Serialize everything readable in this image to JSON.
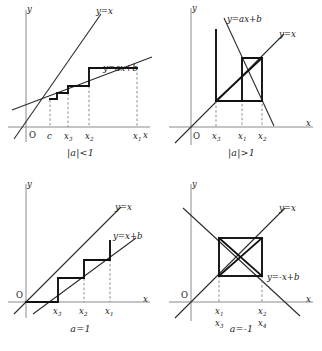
{
  "figure": {
    "panels": [
      {
        "id": "top-left",
        "caption": "|a|<1",
        "axis_x_label": "x",
        "axis_y_label": "y",
        "origin_label": "O",
        "line_identity": "y=x",
        "line_map": "y=ax+b",
        "x_ticks": [
          "c",
          "x",
          "x",
          "x"
        ],
        "x_tick_subs": [
          "",
          "3",
          "2",
          "1"
        ],
        "behavior": "converging staircase toward fixed point c"
      },
      {
        "id": "top-right",
        "caption": "|a|>1",
        "axis_x_label": "x",
        "axis_y_label": "y",
        "origin_label": "O",
        "line_identity": "y=x",
        "line_map": "y=ax+b",
        "x_ticks": [
          "x",
          "x",
          "x"
        ],
        "x_tick_subs": [
          "3",
          "1",
          "2"
        ],
        "behavior": "diverging cobweb away from fixed point"
      },
      {
        "id": "bottom-left",
        "caption": "a=1",
        "axis_x_label": "x",
        "axis_y_label": "y",
        "origin_label": "O",
        "line_identity": "y=x",
        "line_map": "y=x+b",
        "x_ticks": [
          "x",
          "x",
          "x"
        ],
        "x_tick_subs": [
          "3",
          "2",
          "1"
        ],
        "behavior": "monotone ascending staircase, no fixed point"
      },
      {
        "id": "bottom-right",
        "caption": "a=-1",
        "axis_x_label": "x",
        "axis_y_label": "y",
        "origin_label": "O",
        "line_identity": "y=x",
        "line_map": "y=-x+b",
        "x_ticks_row1": [
          "x",
          "x"
        ],
        "x_tick_subs_row1": [
          "1",
          "2"
        ],
        "x_ticks_row2": [
          "x",
          "x"
        ],
        "x_tick_subs_row2": [
          "3",
          "4"
        ],
        "behavior": "period-two square cycle with diagonals"
      }
    ],
    "colors": {
      "ink": "#1a1a1a",
      "axis": "#8a8a8a",
      "curve": "#2b2b2b",
      "cobweb": "#111111",
      "dashed": "#7d7d7d",
      "background": "#ffffff"
    }
  }
}
